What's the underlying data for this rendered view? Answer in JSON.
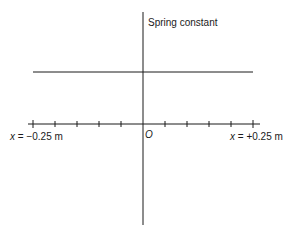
{
  "diagram": {
    "y_axis_label": "Spring constant",
    "origin_label": "O",
    "x_left_label_var": "x",
    "x_left_label_value": " = −0.25 m",
    "x_right_label_var": "x",
    "x_right_label_value": " = +0.25 m",
    "x_min": -0.25,
    "x_max": 0.25,
    "x_unit": "m",
    "tick_count_per_side": 5,
    "tick_spacing_m": 0.05,
    "constant_line": "horizontal line above x-axis spanning x = -0.25 m to x = +0.25 m",
    "line_color": "#1a1a1a"
  }
}
